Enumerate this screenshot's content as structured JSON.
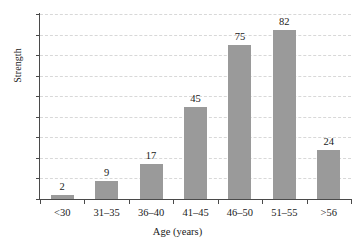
{
  "chart_data": {
    "type": "bar",
    "title": "",
    "subtitle": "",
    "xlabel": "Age (years)",
    "ylabel": "Strength",
    "categories": [
      "<30",
      "31–35",
      "36–40",
      "41–45",
      "46–50",
      "51–55",
      ">56"
    ],
    "values": [
      2,
      9,
      17,
      45,
      75,
      82,
      24
    ],
    "data_labels": [
      "2",
      "9",
      "17",
      "45",
      "75",
      "82",
      "24"
    ],
    "ylim": [
      0,
      90
    ],
    "ytick_step": 10,
    "ytick_labels": [
      "0",
      "10",
      "20",
      "30",
      "40",
      "50",
      "60",
      "70",
      "80",
      "90"
    ],
    "grid": true,
    "grid_axis": "y",
    "grid_style": "dashed",
    "legend": "none",
    "legend_position": "none",
    "bar_color": "#9a9a9a",
    "grid_color": "#d8d8d8",
    "axis_color": "#4a4a4a",
    "text_color": "#1a1a1a",
    "background_color": "#ffffff"
  }
}
